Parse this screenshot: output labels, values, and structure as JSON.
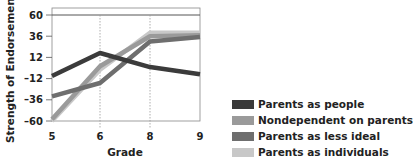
{
  "chart_data": {
    "type": "line",
    "title": "",
    "xlabel": "Grade",
    "ylabel": "Strength of Endorsement",
    "categories": [
      "5",
      "6",
      "8",
      "9"
    ],
    "ylim": [
      -60,
      60
    ],
    "yticks": [
      60,
      36,
      12,
      -12,
      -36,
      -60
    ],
    "grid": "dotted vertical lines at grades 6 and 8",
    "legend_position": "lower right, outside plot",
    "series": [
      {
        "name": "Parents as people",
        "color": "#3a3a3a",
        "values": [
          -9,
          17,
          1,
          -7
        ]
      },
      {
        "name": "Nondependent on parents",
        "color": "#9a9a9a",
        "values": [
          -58,
          2,
          36,
          37
        ]
      },
      {
        "name": "Parents as less ideal",
        "color": "#6e6e6e",
        "values": [
          -32,
          -17,
          30,
          35
        ]
      },
      {
        "name": "Parents as individuals",
        "color": "#c8c8c8",
        "values": [
          -60,
          -2,
          40,
          40
        ]
      }
    ]
  },
  "legend": {
    "items": [
      {
        "label": "Parents as people",
        "color": "#3a3a3a"
      },
      {
        "label": "Nondependent on parents",
        "color": "#9a9a9a"
      },
      {
        "label": "Parents as less ideal",
        "color": "#6e6e6e"
      },
      {
        "label": "Parents as individuals",
        "color": "#c8c8c8"
      }
    ]
  },
  "axes": {
    "x_title": "Grade",
    "y_title": "Strength of Endorsement",
    "x_ticks": [
      "5",
      "6",
      "8",
      "9"
    ],
    "y_ticks": [
      "60",
      "36",
      "12",
      "-12",
      "-36",
      "-60"
    ]
  }
}
